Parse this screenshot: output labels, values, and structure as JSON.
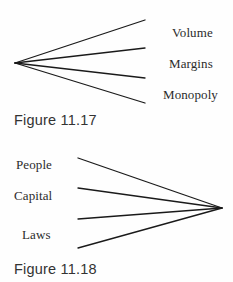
{
  "page": {
    "background_color": "#fefefe",
    "width": 233,
    "height": 282,
    "ink_color": "#1a1a1a",
    "text_color": "#2b2b2b"
  },
  "figures": [
    {
      "id": "11.17",
      "caption": "Figure 11.17",
      "direction": "diverging-right",
      "apex": {
        "x": 15,
        "y": 63
      },
      "branch_count": 4,
      "branch_endpoints": [
        {
          "x": 145,
          "y": 20
        },
        {
          "x": 145,
          "y": 48
        },
        {
          "x": 145,
          "y": 78
        },
        {
          "x": 145,
          "y": 103
        }
      ],
      "labels": [
        {
          "text": "Volume"
        },
        {
          "text": "Margins"
        },
        {
          "text": "Monopoly"
        }
      ]
    },
    {
      "id": "11.18",
      "caption": "Figure 11.18",
      "direction": "converging-right",
      "apex": {
        "x": 222,
        "y": 67
      },
      "branch_count": 4,
      "branch_endpoints": [
        {
          "x": 78,
          "y": 17
        },
        {
          "x": 78,
          "y": 47
        },
        {
          "x": 78,
          "y": 78
        },
        {
          "x": 78,
          "y": 107
        }
      ],
      "labels": [
        {
          "text": "People"
        },
        {
          "text": "Capital"
        },
        {
          "text": "Laws"
        }
      ]
    }
  ]
}
